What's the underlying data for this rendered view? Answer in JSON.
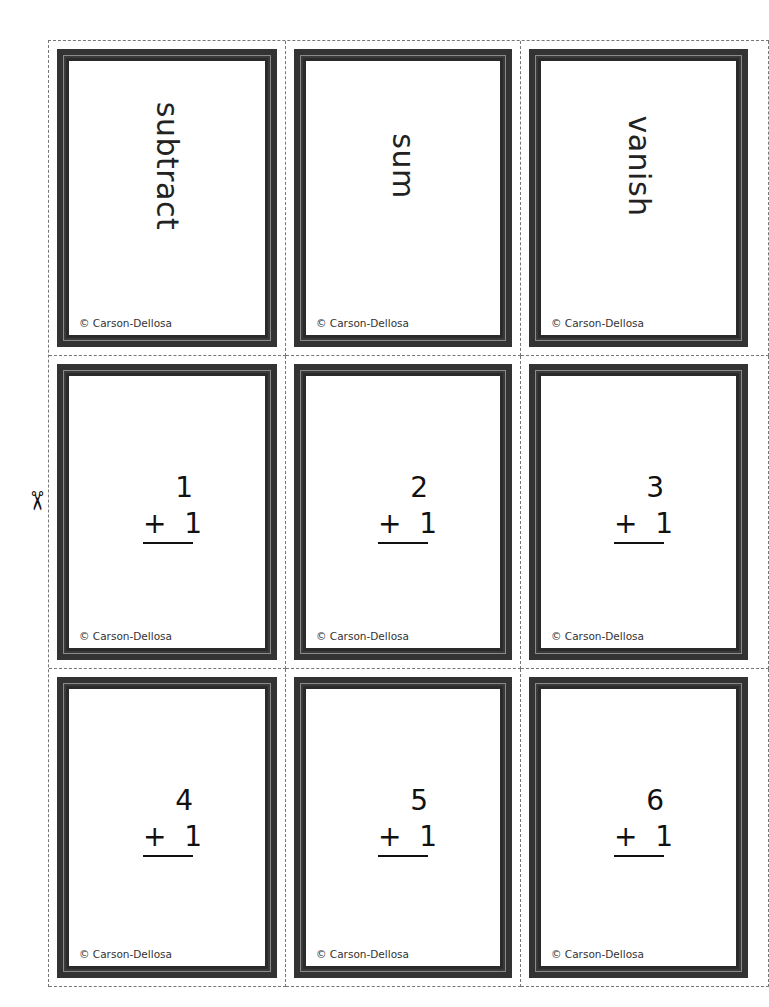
{
  "copyright": "© Carson-Dellosa",
  "scissors_icon": "✂",
  "cards": [
    {
      "type": "word",
      "text": "subtract"
    },
    {
      "type": "word",
      "text": "sum"
    },
    {
      "type": "word",
      "text": "vanish"
    },
    {
      "type": "math",
      "top": "1",
      "op": "+",
      "bottom": "1"
    },
    {
      "type": "math",
      "top": "2",
      "op": "+",
      "bottom": "1"
    },
    {
      "type": "math",
      "top": "3",
      "op": "+",
      "bottom": "1"
    },
    {
      "type": "math",
      "top": "4",
      "op": "+",
      "bottom": "1"
    },
    {
      "type": "math",
      "top": "5",
      "op": "+",
      "bottom": "1"
    },
    {
      "type": "math",
      "top": "6",
      "op": "+",
      "bottom": "1"
    }
  ],
  "colors": {
    "frame": "#2a2a2a",
    "frame_line": "#8a8a8a",
    "cut_line": "#777777"
  }
}
